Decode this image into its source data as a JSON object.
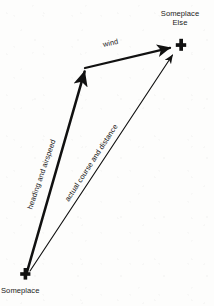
{
  "diagram": {
    "background_color": "#fdfdfc",
    "ink_color": "#111111",
    "nodes": [
      {
        "id": "someplace",
        "label": "Someplace",
        "marker": "cross-marker",
        "x": 25,
        "y": 274
      },
      {
        "id": "someplace-else",
        "label": "Someplace\nElse",
        "marker": "cross-marker",
        "x": 181,
        "y": 45
      }
    ],
    "edges": [
      {
        "id": "heading-airspeed",
        "label": "heading and airspeed",
        "from": "someplace",
        "to": "wind-origin",
        "style": "thick-arrow",
        "stroke_width": 2.6,
        "x1": 27,
        "y1": 272,
        "x2": 84,
        "y2": 70
      },
      {
        "id": "wind",
        "label": "wind",
        "from": "wind-origin",
        "to": "someplace-else",
        "style": "thick-arrow",
        "stroke_width": 2.4,
        "x1": 85,
        "y1": 68,
        "x2": 172,
        "y2": 47
      },
      {
        "id": "actual-course-distance",
        "label": "actual course and distance",
        "from": "someplace",
        "to": "someplace-else",
        "style": "thin-arrow",
        "stroke_width": 1.1,
        "x1": 30,
        "y1": 271,
        "x2": 174,
        "y2": 53
      }
    ]
  }
}
